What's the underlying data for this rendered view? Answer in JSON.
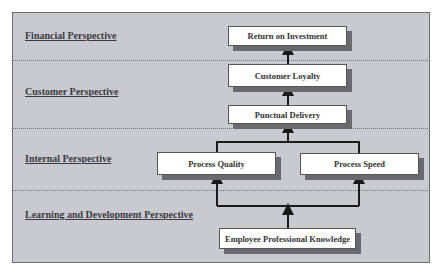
{
  "diagram": {
    "title_fragment": "",
    "perspectives": [
      {
        "id": "financial",
        "label": "Financial Perspective"
      },
      {
        "id": "customer",
        "label": "Customer Perspective"
      },
      {
        "id": "internal",
        "label": "Internal Perspective"
      },
      {
        "id": "learning",
        "label": "Learning and Development Perspective"
      }
    ],
    "nodes": [
      {
        "id": "roi",
        "label": "Return on Investment",
        "perspective": "financial"
      },
      {
        "id": "loyalty",
        "label": "Customer Loyalty",
        "perspective": "customer"
      },
      {
        "id": "delivery",
        "label": "Punctual Delivery",
        "perspective": "customer"
      },
      {
        "id": "quality",
        "label": "Process Quality",
        "perspective": "internal"
      },
      {
        "id": "speed",
        "label": "Process Speed",
        "perspective": "internal"
      },
      {
        "id": "knowledge",
        "label": "Employee Professional Knowledge",
        "perspective": "learning"
      }
    ],
    "edges": [
      {
        "from": "knowledge",
        "to": "quality"
      },
      {
        "from": "knowledge",
        "to": "speed"
      },
      {
        "from": "quality",
        "to": "delivery"
      },
      {
        "from": "speed",
        "to": "delivery"
      },
      {
        "from": "delivery",
        "to": "loyalty"
      },
      {
        "from": "loyalty",
        "to": "roi"
      }
    ],
    "colors": {
      "background": "#c9cacf",
      "node_fill": "#ffffff",
      "shadow": "#6a6a6e",
      "line": "#1a1a1a",
      "label_text": "#3a3a3e"
    }
  }
}
